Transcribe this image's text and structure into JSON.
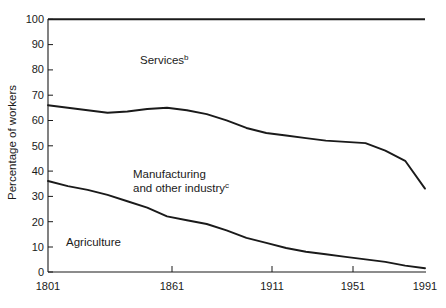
{
  "chart_data": {
    "type": "line",
    "title": "",
    "subtitle": "",
    "xlabel": "",
    "ylabel": "Percentage of workers",
    "xlim": [
      1801,
      1991
    ],
    "ylim": [
      0,
      100
    ],
    "grid": false,
    "legend_position": "inline-annotations",
    "x_tick_labels": [
      "1801",
      "1861",
      "1911",
      "1951",
      "1991"
    ],
    "x_ticks": [
      1801,
      1861,
      1911,
      1951,
      1991
    ],
    "y_tick_labels": [
      "0",
      "10",
      "20",
      "30",
      "40",
      "50",
      "60",
      "70",
      "80",
      "90",
      "100"
    ],
    "y_ticks": [
      0,
      10,
      20,
      30,
      40,
      50,
      60,
      70,
      80,
      90,
      100
    ],
    "annotations": [
      {
        "text": "Services",
        "superscript": "b",
        "x": 1861,
        "y": 84
      },
      {
        "text": "Manufacturing",
        "superscript": "",
        "x": 1855,
        "y": 41
      },
      {
        "text": "and other industry",
        "superscript": "c",
        "x": 1855,
        "y": 35
      },
      {
        "text": "Agriculture",
        "superscript": "",
        "x": 1825,
        "y": 13
      }
    ],
    "series": [
      {
        "name": "Agriculture (cumulative lower boundary)",
        "x": [
          1801,
          1811,
          1821,
          1831,
          1841,
          1851,
          1861,
          1871,
          1881,
          1891,
          1901,
          1911,
          1921,
          1931,
          1941,
          1951,
          1961,
          1971,
          1981,
          1991
        ],
        "values": [
          36,
          34,
          32.5,
          30.5,
          28,
          25.5,
          22,
          20.5,
          19,
          16.5,
          13.5,
          11.5,
          9.5,
          8,
          7,
          6,
          5,
          4,
          2.5,
          1.5
        ]
      },
      {
        "name": "Agriculture + Manufacturing and other industry (cumulative upper boundary)",
        "x": [
          1801,
          1811,
          1821,
          1831,
          1841,
          1851,
          1861,
          1871,
          1881,
          1891,
          1901,
          1911,
          1921,
          1931,
          1941,
          1951,
          1961,
          1971,
          1981,
          1991
        ],
        "values": [
          66,
          65,
          64,
          63,
          63.5,
          64.5,
          65,
          64,
          62.5,
          60,
          57,
          55,
          54,
          53,
          52,
          51.5,
          51,
          48,
          44,
          33
        ]
      },
      {
        "name": "Total (100%)",
        "x": [
          1801,
          1991
        ],
        "values": [
          100,
          100
        ]
      }
    ],
    "bands": [
      {
        "name": "Agriculture",
        "order": 1
      },
      {
        "name": "Manufacturing and other industry",
        "order": 2
      },
      {
        "name": "Services",
        "order": 3
      }
    ]
  }
}
